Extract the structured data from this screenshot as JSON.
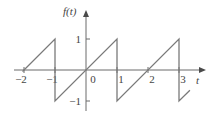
{
  "chart_data": {
    "type": "line",
    "title": "",
    "xlabel": "t",
    "ylabel": "f(t)",
    "xlim": [
      -2.3,
      3.8
    ],
    "ylim": [
      -1.3,
      1.9
    ],
    "x_ticks": [
      {
        "value": -2,
        "label": "−2"
      },
      {
        "value": -1,
        "label": "−1"
      },
      {
        "value": 0,
        "label": "0"
      },
      {
        "value": 1,
        "label": "1"
      },
      {
        "value": 2,
        "label": "2"
      },
      {
        "value": 3,
        "label": "3"
      }
    ],
    "y_ticks": [
      {
        "value": 1,
        "label": "1"
      },
      {
        "value": -1,
        "label": "−1"
      }
    ],
    "grid": false,
    "legend": "none",
    "series": [
      {
        "name": "f(t)",
        "description": "sawtooth wave, period 2, f(t)=t on (-1,1)",
        "x": [
          -2.05,
          -1,
          -1,
          1,
          1,
          3,
          3,
          3.35
        ],
        "y": [
          -0.05,
          1,
          -1,
          1,
          -1,
          1,
          -1,
          -0.65
        ]
      }
    ]
  }
}
